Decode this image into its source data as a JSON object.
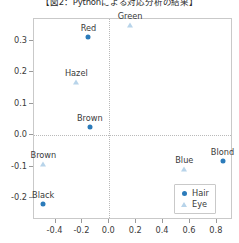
{
  "caption": "【図2：Pythonによる対応分析の結果】",
  "chart_data": {
    "type": "scatter",
    "title": "【図2：Pythonによる対応分析の結果】",
    "xlabel": "",
    "ylabel": "",
    "xlim": [
      -0.56,
      0.92
    ],
    "ylim": [
      -0.27,
      0.37
    ],
    "grid": true,
    "grid_style": "dotted reference lines at x=0 and y=0",
    "legend_position": "lower right",
    "xticks": [
      "-0.4",
      "-0.2",
      "0.0",
      "0.2",
      "0.4",
      "0.6",
      "0.8"
    ],
    "xtick_values": [
      -0.4,
      -0.2,
      0.0,
      0.2,
      0.4,
      0.6,
      0.8
    ],
    "yticks": [
      "0.3",
      "0.2",
      "0.1",
      "0.0",
      "-0.1",
      "-0.2"
    ],
    "ytick_values": [
      0.3,
      0.2,
      0.1,
      0.0,
      -0.1,
      -0.2
    ],
    "series": [
      {
        "name": "Hair",
        "marker": "circle",
        "color": "#2b7bba",
        "points": [
          {
            "label": "Red",
            "x": -0.155,
            "y": 0.312
          },
          {
            "label": "Brown",
            "x": -0.145,
            "y": 0.027
          },
          {
            "label": "Black",
            "x": -0.492,
            "y": -0.218
          },
          {
            "label": "Blond",
            "x": 0.842,
            "y": -0.082
          }
        ]
      },
      {
        "name": "Eye",
        "marker": "triangle",
        "color": "#b8d4ea",
        "points": [
          {
            "label": "Green",
            "x": 0.155,
            "y": 0.352
          },
          {
            "label": "Hazel",
            "x": -0.245,
            "y": 0.168
          },
          {
            "label": "Brown",
            "x": -0.49,
            "y": -0.092
          },
          {
            "label": "Blue",
            "x": 0.558,
            "y": -0.108
          }
        ]
      }
    ]
  },
  "legend": {
    "entries": [
      {
        "label": "Hair",
        "marker": "circle",
        "color": "#2b7bba"
      },
      {
        "label": "Eye",
        "marker": "triangle",
        "color": "#b8d4ea"
      }
    ]
  }
}
